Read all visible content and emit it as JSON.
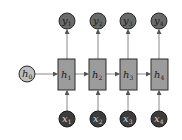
{
  "diagram": {
    "type": "unrolled-rnn",
    "initial_state": {
      "label": "h",
      "sub": "0"
    },
    "hidden": [
      {
        "label": "h",
        "sub": "1"
      },
      {
        "label": "h",
        "sub": "2"
      },
      {
        "label": "h",
        "sub": "3"
      },
      {
        "label": "h",
        "sub": "4"
      }
    ],
    "inputs": [
      {
        "label": "x",
        "sub": "1"
      },
      {
        "label": "x",
        "sub": "2"
      },
      {
        "label": "x",
        "sub": "3"
      },
      {
        "label": "x",
        "sub": "4"
      }
    ],
    "outputs": [
      {
        "label": "y",
        "sub": "1"
      },
      {
        "label": "y",
        "sub": "2"
      },
      {
        "label": "y",
        "sub": "3"
      },
      {
        "label": "y",
        "sub": "4"
      }
    ],
    "colors": {
      "input_fill": "#3c3c3c",
      "output_fill": "#6a6a6a",
      "hidden_fill": "#9c9c9c",
      "initial_fill": "#bdbdbd",
      "stroke": "#2a2a2a",
      "arrow": "#8a8a8a"
    }
  }
}
